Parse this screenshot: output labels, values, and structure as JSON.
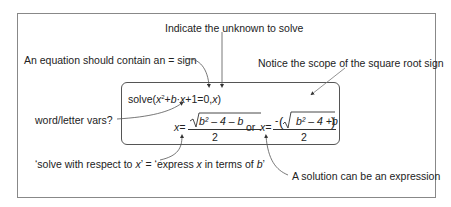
{
  "annotations": {
    "unknown": "Indicate the unknown to solve",
    "equals_sign": "An equation should contain an = sign",
    "sqrt_scope": "Notice the scope of the square root sign",
    "word_vars": "word/letter vars?",
    "respect_to_prefix": "‘solve with respect to ",
    "respect_to_var": "x",
    "respect_to_mid": "’ = ‘express ",
    "respect_to_var2": "x",
    "respect_to_mid2": " in terms of ",
    "respect_to_var3": "b",
    "respect_to_suffix": "’",
    "solution_expression": "A solution can be an expression"
  },
  "formula": {
    "solve_fn": "solve(",
    "x_var": "x",
    "sq": "2",
    "plus_b": "+",
    "b_var": "b",
    "dot_x": "·",
    "x2": "x",
    "rest": "+1=0,",
    "x3": "x",
    "close": ")",
    "sol1_lhs": "x=",
    "sol1_num": "b² – 4  – b",
    "sol1_den": "2",
    "or_label": "or",
    "sol2_lhs": "x=",
    "sol2_num": "b² –  4  +b",
    "sol2_den": "2"
  },
  "colors": {
    "frame": "#888888",
    "inner_box": "#555555",
    "arrow": "#333333"
  }
}
